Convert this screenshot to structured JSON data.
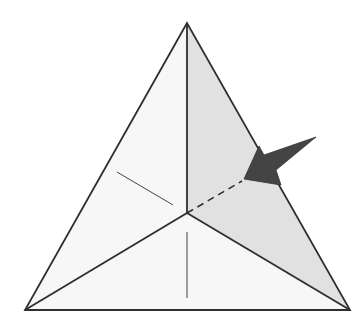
{
  "diagram": {
    "type": "origami-fold-diagram",
    "colors": {
      "background": "#ffffff",
      "face_light": "#f7f7f7",
      "face_shaded": "#e1e1e1",
      "edge": "#2e2e2e",
      "thin_line": "#444444",
      "arrow_fill": "#444444"
    },
    "vertices": {
      "apex": [
        187,
        23
      ],
      "bottom_left": [
        25,
        310
      ],
      "bottom_right": [
        350,
        310
      ],
      "center": [
        187,
        213
      ]
    },
    "shaded_face": "apex-center-bottom_right",
    "thin_lines": [
      {
        "name": "left-crease",
        "from": [
          117,
          172
        ],
        "to": [
          173,
          205
        ]
      },
      {
        "name": "bottom-crease",
        "from": [
          187,
          232
        ],
        "to": [
          187,
          298
        ]
      }
    ],
    "dashed_line": {
      "name": "hidden-crease",
      "from": [
        187,
        213
      ],
      "to": [
        242,
        181
      ]
    },
    "arrow": {
      "kind": "push-arrow",
      "points": [
        [
          244,
          179
        ],
        [
          259,
          146
        ],
        [
          264,
          155
        ],
        [
          316,
          137
        ],
        [
          276,
          170
        ],
        [
          281,
          185
        ]
      ]
    }
  }
}
